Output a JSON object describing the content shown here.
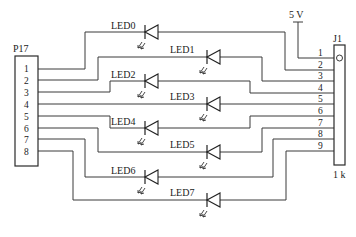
{
  "diagram": {
    "type": "circuit-schematic",
    "left_connector": {
      "label": "P17",
      "pins": [
        "1",
        "2",
        "3",
        "4",
        "5",
        "6",
        "7",
        "8"
      ]
    },
    "right_connector": {
      "label": "J1",
      "pins": [
        "1",
        "2",
        "3",
        "4",
        "5",
        "6",
        "7",
        "8",
        "9"
      ],
      "value": "1 k"
    },
    "power": {
      "label": "5 V",
      "connects_to": "J1 pin 1"
    },
    "leds": [
      {
        "label": "LED0",
        "from": "P17 pin 1",
        "to": "J1 pin 2"
      },
      {
        "label": "LED1",
        "from": "P17 pin 2",
        "to": "J1 pin 3"
      },
      {
        "label": "LED2",
        "from": "P17 pin 3",
        "to": "J1 pin 4"
      },
      {
        "label": "LED3",
        "from": "P17 pin 4",
        "to": "J1 pin 5"
      },
      {
        "label": "LED4",
        "from": "P17 pin 5",
        "to": "J1 pin 6"
      },
      {
        "label": "LED5",
        "from": "P17 pin 6",
        "to": "J1 pin 7"
      },
      {
        "label": "LED6",
        "from": "P17 pin 7",
        "to": "J1 pin 8"
      },
      {
        "label": "LED7",
        "from": "P17 pin 8",
        "to": "J1 pin 9"
      }
    ],
    "colors": {
      "line": "#3a3a3a",
      "background": "#ffffff"
    }
  }
}
